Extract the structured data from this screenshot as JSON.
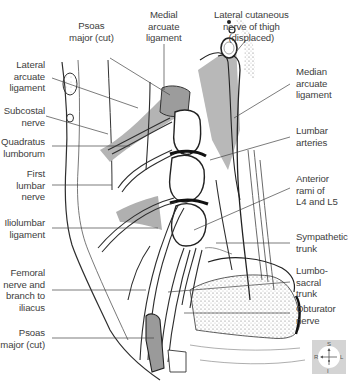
{
  "figure": {
    "type": "anatomical-illustration",
    "shade_color": "#a9a9a9",
    "line_color": "#2e2e2e"
  },
  "labels_top": [
    {
      "id": "psoas-major-cut-top",
      "lines": [
        "Psoas",
        "major (cut)"
      ]
    },
    {
      "id": "medial-arcuate-ligament",
      "lines": [
        "Medial",
        "arcuate",
        "ligament"
      ]
    },
    {
      "id": "lateral-cutaneous-nerve",
      "lines": [
        "Lateral cutaneous",
        "nerve of thigh",
        "(displaced)"
      ]
    }
  ],
  "labels_left": [
    {
      "id": "lateral-arcuate-ligament",
      "lines": [
        "Lateral",
        "arcuate",
        "ligament"
      ]
    },
    {
      "id": "subcostal-nerve",
      "lines": [
        "Subcostal",
        "nerve"
      ]
    },
    {
      "id": "quadratus-lumborum",
      "lines": [
        "Quadratus",
        "lumborum"
      ]
    },
    {
      "id": "first-lumbar-nerve",
      "lines": [
        "First",
        "lumbar",
        "nerve"
      ]
    },
    {
      "id": "iliolumbar-ligament",
      "lines": [
        "Iliolumbar",
        "ligament"
      ]
    },
    {
      "id": "femoral-nerve",
      "lines": [
        "Femoral",
        "nerve and",
        "branch to",
        "iliacus"
      ]
    },
    {
      "id": "psoas-major-cut-bottom",
      "lines": [
        "Psoas",
        "major (cut)"
      ]
    }
  ],
  "labels_right": [
    {
      "id": "median-arcuate-ligament",
      "lines": [
        "Median",
        "arcuate",
        "ligament"
      ]
    },
    {
      "id": "lumbar-arteries",
      "lines": [
        "Lumbar",
        "arteries"
      ]
    },
    {
      "id": "anterior-rami",
      "lines": [
        "Anterior",
        "rami of",
        "L4 and L5"
      ]
    },
    {
      "id": "sympathetic-trunk",
      "lines": [
        "Sympathetic",
        "trunk"
      ]
    },
    {
      "id": "lumbosacral-trunk",
      "lines": [
        "Lumbo-",
        "sacral",
        "trunk"
      ]
    },
    {
      "id": "obturator-nerve",
      "lines": [
        "Obturator",
        "nerve"
      ]
    }
  ],
  "orientation": {
    "superior": "S",
    "inferior": "I",
    "right": "R",
    "left": "L"
  }
}
